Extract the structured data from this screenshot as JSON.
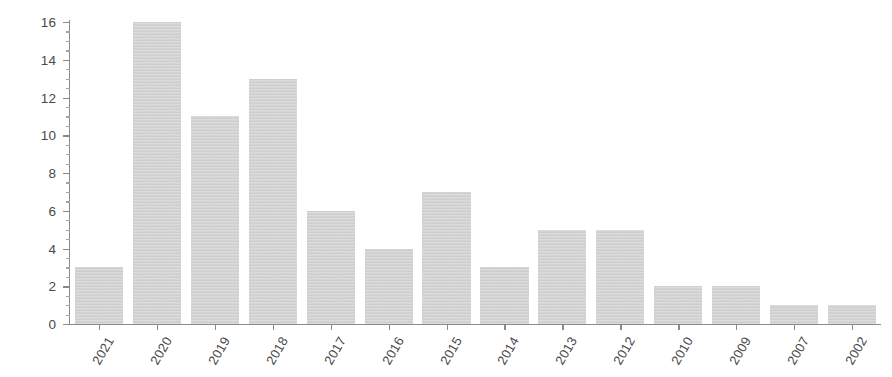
{
  "chart_data": {
    "type": "bar",
    "title": "",
    "subtitle": "",
    "xlabel": "",
    "ylabel": "",
    "categories": [
      "2021",
      "2020",
      "2019",
      "2018",
      "2017",
      "2016",
      "2015",
      "2014",
      "2013",
      "2012",
      "2010",
      "2009",
      "2007",
      "2002"
    ],
    "values": [
      3,
      16,
      11,
      13,
      6,
      4,
      7,
      3,
      5,
      5,
      2,
      2,
      1,
      1
    ],
    "ylim": [
      0,
      16
    ],
    "y_ticks": [
      0,
      2,
      4,
      6,
      8,
      10,
      12,
      14,
      16
    ],
    "y_tick_labels": [
      "0",
      "2",
      "4",
      "6",
      "8",
      "10",
      "12",
      "14",
      "16"
    ],
    "y_minor_tick_step": 0.5,
    "grid": false,
    "legend": null,
    "legend_position": "none",
    "bar_color": "#d2d2d2",
    "axis_color": "#8a8a8a",
    "tick_label_color": "#4a4a4a",
    "background_color": "#ffffff",
    "x_tick_label_rotation": -60,
    "annotations": []
  }
}
